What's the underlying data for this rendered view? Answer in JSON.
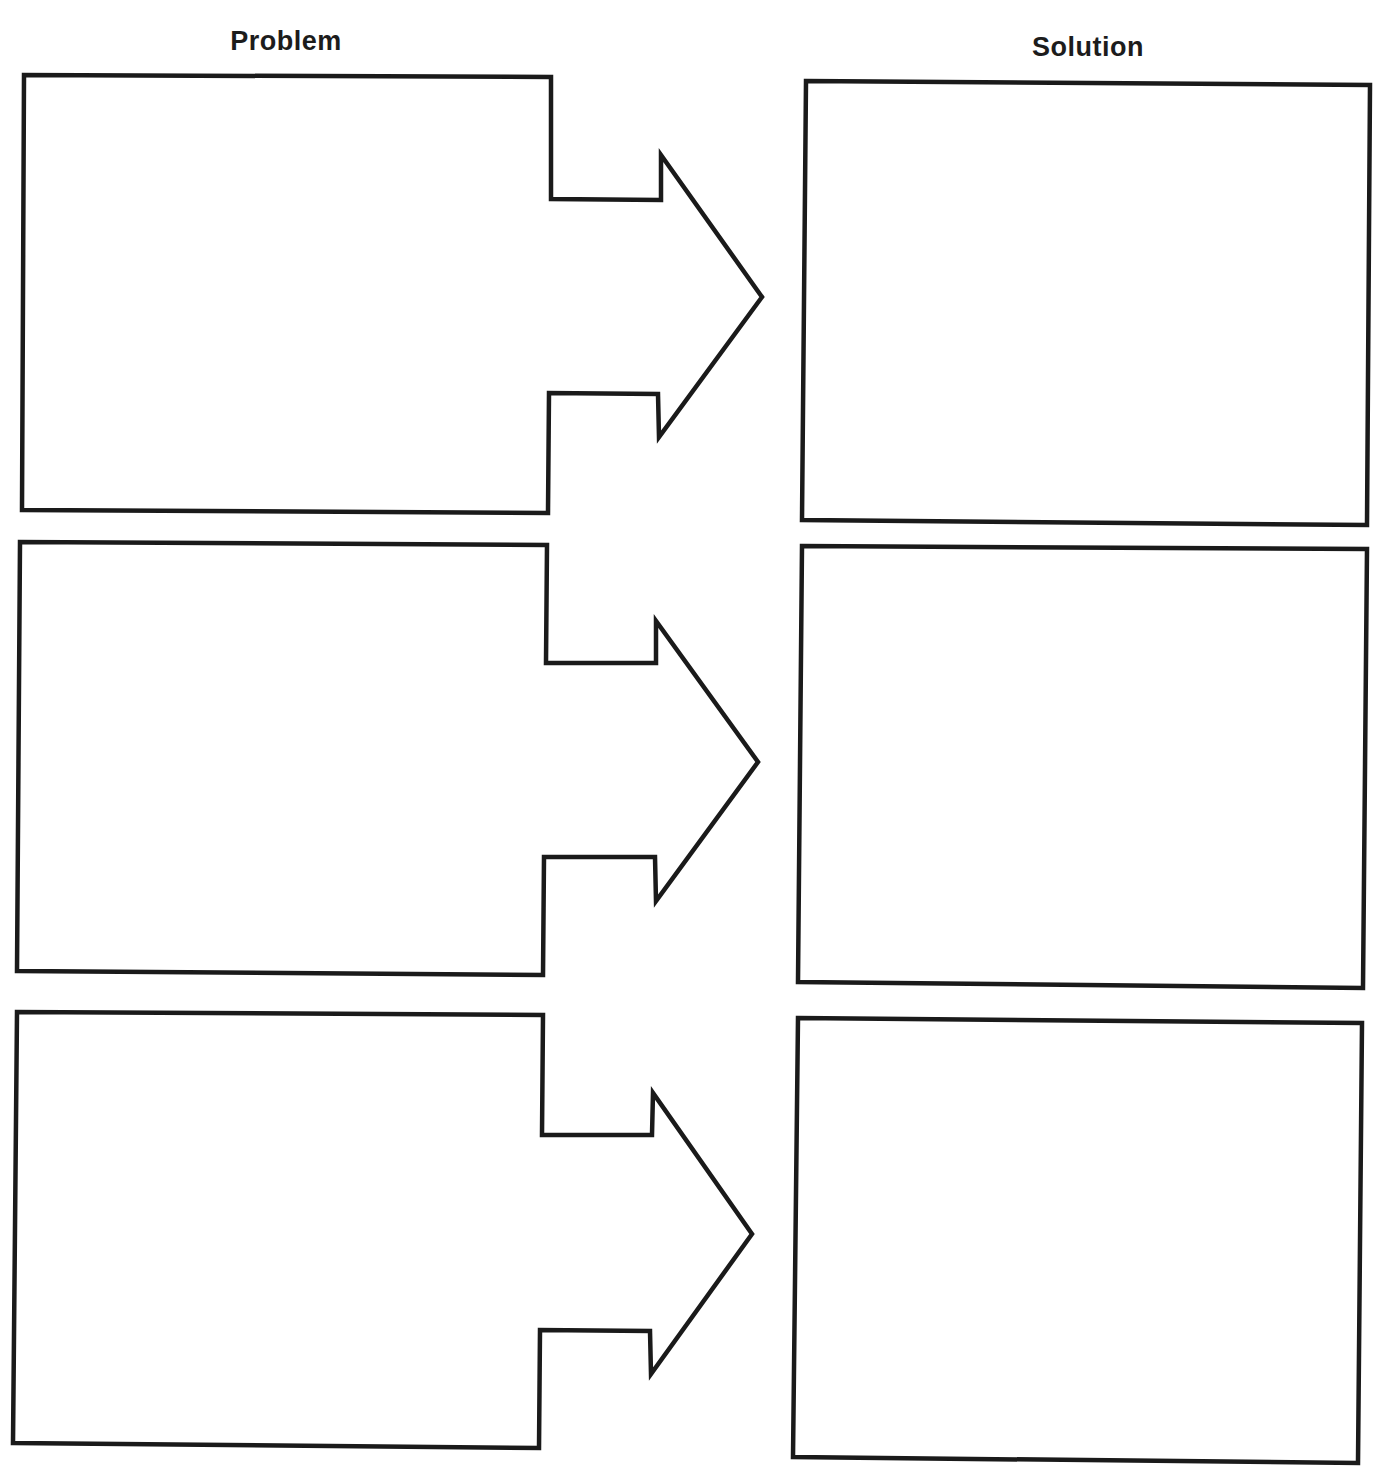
{
  "worksheet": {
    "headers": {
      "problem": "Problem",
      "solution": "Solution"
    },
    "rows": [
      {
        "index": 1,
        "problem_text": "",
        "solution_text": "",
        "problem_shape": "22,510 548,513 549,393 658,394 659,437 762,297 661,155 661,200 551,199 551,77 24,75",
        "solution_shape": "806,81 1370,85 1367,525 802,520"
      },
      {
        "index": 2,
        "problem_text": "",
        "solution_text": "",
        "problem_shape": "17,971 543,975 544,857 655,857 656,901 758,762 656,621 656,663 546,663 547,545 20,542",
        "solution_shape": "802,546 1367,549 1363,988 798,982"
      },
      {
        "index": 3,
        "problem_text": "",
        "solution_text": "",
        "problem_shape": "13,1443 539,1448 540,1330 650,1331 651,1374 752,1234 653,1093 652,1135 542,1135 543,1015 17,1012",
        "solution_shape": "798,1018 1362,1023 1358,1463 793,1457"
      }
    ],
    "colors": {
      "stroke": "#1a1a1a",
      "background": "#ffffff",
      "text": "#1c1c1c"
    }
  }
}
